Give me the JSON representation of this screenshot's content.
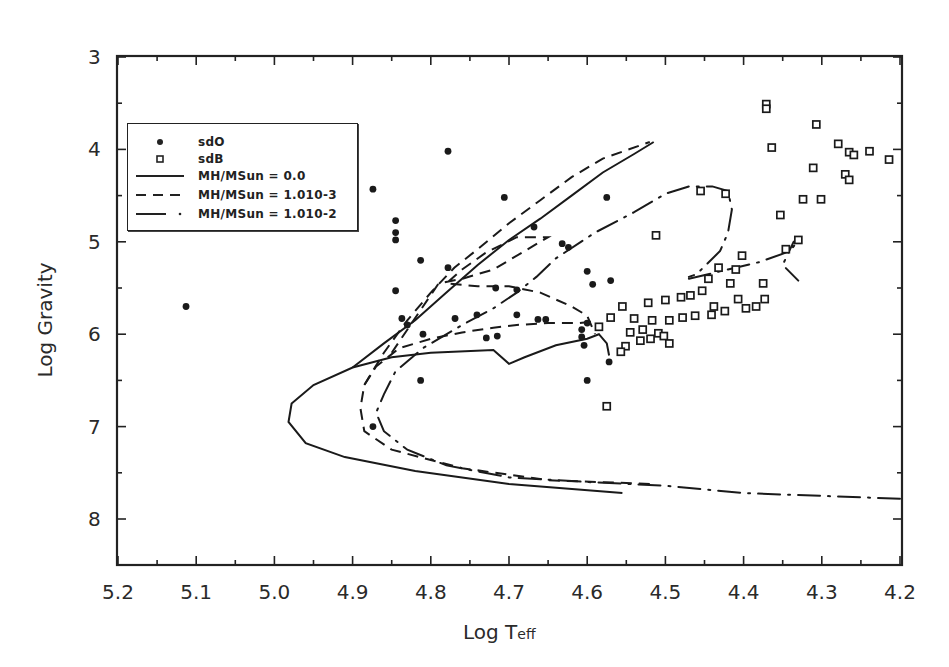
{
  "chart_data": {
    "type": "scatter",
    "title": "",
    "xlabel": "Log Teff",
    "xlabel_main": "Log T",
    "xlabel_sub": "eff",
    "ylabel": "Log Gravity",
    "xlim": [
      5.2,
      4.2
    ],
    "ylim": [
      8.5,
      3
    ],
    "x_reversed": true,
    "y_reversed": true,
    "grid": false,
    "legend_position": "upper-left",
    "x_ticks": [
      "5.2",
      "5.1",
      "5.0",
      "4.9",
      "4.8",
      "4.7",
      "4.6",
      "4.5",
      "4.4",
      "4.3",
      "4.2"
    ],
    "y_ticks": [
      "3",
      "4",
      "5",
      "6",
      "7",
      "8"
    ],
    "legend": [
      {
        "symbol": "filled-circle",
        "label": "sdO"
      },
      {
        "symbol": "open-square",
        "label": "sdB"
      },
      {
        "symbol": "solid-line",
        "label": "MH/MSun = 0.0"
      },
      {
        "symbol": "dashed-line",
        "label": "MH/MSun = 1.010-3"
      },
      {
        "symbol": "dash-dot-line",
        "label": "MH/MSun = 1.010-2"
      }
    ],
    "series": [
      {
        "name": "sdO",
        "kind": "points",
        "marker": "filled-circle",
        "points": [
          [
            5.113,
            5.7
          ],
          [
            4.874,
            4.43
          ],
          [
            4.845,
            4.77
          ],
          [
            4.845,
            4.9
          ],
          [
            4.845,
            4.98
          ],
          [
            4.845,
            5.53
          ],
          [
            4.837,
            5.83
          ],
          [
            4.83,
            5.9
          ],
          [
            4.813,
            5.2
          ],
          [
            4.813,
            6.5
          ],
          [
            4.778,
            4.02
          ],
          [
            4.778,
            5.28
          ],
          [
            4.769,
            5.83
          ],
          [
            4.741,
            5.79
          ],
          [
            4.717,
            5.5
          ],
          [
            4.729,
            6.04
          ],
          [
            4.706,
            4.52
          ],
          [
            4.69,
            5.52
          ],
          [
            4.69,
            5.79
          ],
          [
            4.668,
            4.84
          ],
          [
            4.663,
            5.84
          ],
          [
            4.653,
            5.84
          ],
          [
            4.632,
            5.02
          ],
          [
            4.624,
            5.06
          ],
          [
            4.6,
            5.32
          ],
          [
            4.593,
            5.46
          ],
          [
            4.6,
            5.88
          ],
          [
            4.607,
            5.95
          ],
          [
            4.607,
            6.03
          ],
          [
            4.604,
            6.12
          ],
          [
            4.575,
            4.52
          ],
          [
            4.57,
            5.42
          ],
          [
            4.572,
            6.3
          ],
          [
            4.6,
            6.5
          ],
          [
            4.715,
            6.02
          ],
          [
            4.874,
            7.0
          ],
          [
            4.81,
            6.0
          ]
        ]
      },
      {
        "name": "sdB",
        "kind": "points",
        "marker": "open-square",
        "points": [
          [
            4.371,
            3.51
          ],
          [
            4.371,
            3.56
          ],
          [
            4.364,
            3.98
          ],
          [
            4.307,
            3.73
          ],
          [
            4.311,
            4.2
          ],
          [
            4.279,
            3.94
          ],
          [
            4.265,
            4.03
          ],
          [
            4.259,
            4.06
          ],
          [
            4.239,
            4.02
          ],
          [
            4.214,
            4.11
          ],
          [
            4.27,
            4.27
          ],
          [
            4.265,
            4.33
          ],
          [
            4.324,
            4.54
          ],
          [
            4.301,
            4.54
          ],
          [
            4.353,
            4.71
          ],
          [
            4.346,
            5.08
          ],
          [
            4.455,
            4.45
          ],
          [
            4.423,
            4.48
          ],
          [
            4.512,
            4.93
          ],
          [
            4.33,
            4.98
          ],
          [
            4.402,
            5.15
          ],
          [
            4.41,
            5.3
          ],
          [
            4.432,
            5.28
          ],
          [
            4.445,
            5.4
          ],
          [
            4.417,
            5.45
          ],
          [
            4.453,
            5.53
          ],
          [
            4.468,
            5.58
          ],
          [
            4.375,
            5.45
          ],
          [
            4.373,
            5.62
          ],
          [
            4.384,
            5.7
          ],
          [
            4.397,
            5.72
          ],
          [
            4.407,
            5.62
          ],
          [
            4.48,
            5.6
          ],
          [
            4.5,
            5.63
          ],
          [
            4.522,
            5.66
          ],
          [
            4.438,
            5.7
          ],
          [
            4.424,
            5.75
          ],
          [
            4.441,
            5.79
          ],
          [
            4.462,
            5.8
          ],
          [
            4.478,
            5.82
          ],
          [
            4.495,
            5.85
          ],
          [
            4.517,
            5.85
          ],
          [
            4.529,
            5.95
          ],
          [
            4.545,
            5.98
          ],
          [
            4.509,
            5.99
          ],
          [
            4.502,
            6.02
          ],
          [
            4.495,
            6.1
          ],
          [
            4.532,
            6.07
          ],
          [
            4.519,
            6.05
          ],
          [
            4.551,
            6.13
          ],
          [
            4.557,
            6.19
          ],
          [
            4.575,
            6.78
          ],
          [
            4.57,
            5.82
          ],
          [
            4.585,
            5.92
          ],
          [
            4.555,
            5.7
          ],
          [
            4.54,
            5.83
          ]
        ]
      },
      {
        "name": "MH/MSun = 0.0",
        "kind": "line",
        "style": "solid",
        "points": [
          [
            4.555,
            7.72
          ],
          [
            4.7,
            7.62
          ],
          [
            4.82,
            7.48
          ],
          [
            4.91,
            7.33
          ],
          [
            4.96,
            7.18
          ],
          [
            4.982,
            6.95
          ],
          [
            4.978,
            6.75
          ],
          [
            4.95,
            6.55
          ],
          [
            4.9,
            6.36
          ],
          [
            4.85,
            6.25
          ],
          [
            4.8,
            6.2
          ],
          [
            4.72,
            6.17
          ],
          [
            4.7,
            6.32
          ],
          [
            4.68,
            6.25
          ],
          [
            4.64,
            6.12
          ],
          [
            4.6,
            6.05
          ],
          [
            4.585,
            6.0
          ],
          [
            4.575,
            6.1
          ],
          [
            4.572,
            6.23
          ]
        ],
        "upper_branch": [
          [
            4.9,
            6.36
          ],
          [
            4.86,
            6.1
          ],
          [
            4.82,
            5.85
          ],
          [
            4.78,
            5.55
          ],
          [
            4.74,
            5.25
          ],
          [
            4.7,
            4.98
          ],
          [
            4.66,
            4.75
          ],
          [
            4.62,
            4.5
          ],
          [
            4.58,
            4.25
          ],
          [
            4.54,
            4.05
          ],
          [
            4.515,
            3.92
          ]
        ]
      },
      {
        "name": "MH/MSun = 1.010-3",
        "kind": "line",
        "style": "dashed",
        "points": [
          [
            4.52,
            7.62
          ],
          [
            4.65,
            7.58
          ],
          [
            4.76,
            7.45
          ],
          [
            4.85,
            7.25
          ],
          [
            4.885,
            7.05
          ],
          [
            4.89,
            6.8
          ],
          [
            4.885,
            6.55
          ],
          [
            4.87,
            6.35
          ],
          [
            4.84,
            6.15
          ],
          [
            4.8,
            6.05
          ],
          [
            4.76,
            5.98
          ],
          [
            4.72,
            5.93
          ],
          [
            4.69,
            5.9
          ],
          [
            4.65,
            5.88
          ],
          [
            4.61,
            5.88
          ],
          [
            4.59,
            5.86
          ]
        ],
        "upper_branch": [
          [
            4.885,
            6.55
          ],
          [
            4.86,
            6.2
          ],
          [
            4.83,
            5.85
          ],
          [
            4.8,
            5.55
          ],
          [
            4.77,
            5.28
          ],
          [
            4.74,
            5.08
          ],
          [
            4.7,
            4.8
          ],
          [
            4.66,
            4.55
          ],
          [
            4.62,
            4.3
          ],
          [
            4.58,
            4.1
          ],
          [
            4.52,
            3.92
          ]
        ],
        "inner_loop": [
          [
            4.85,
            6.2
          ],
          [
            4.81,
            5.7
          ],
          [
            4.79,
            5.45
          ],
          [
            4.76,
            5.4
          ],
          [
            4.72,
            5.3
          ],
          [
            4.7,
            5.2
          ],
          [
            4.67,
            5.05
          ],
          [
            4.65,
            4.95
          ],
          [
            4.69,
            4.95
          ],
          [
            4.73,
            5.12
          ],
          [
            4.76,
            5.3
          ],
          [
            4.78,
            5.45
          ],
          [
            4.74,
            5.48
          ],
          [
            4.7,
            5.48
          ],
          [
            4.66,
            5.55
          ],
          [
            4.62,
            5.7
          ],
          [
            4.6,
            5.8
          ],
          [
            4.59,
            6.0
          ]
        ]
      },
      {
        "name": "MH/MSun = 1.010-2",
        "kind": "line",
        "style": "dash-dot",
        "points": [
          [
            4.2,
            7.78
          ],
          [
            4.3,
            7.75
          ],
          [
            4.4,
            7.72
          ],
          [
            4.5,
            7.64
          ],
          [
            4.6,
            7.6
          ],
          [
            4.7,
            7.55
          ],
          [
            4.78,
            7.42
          ],
          [
            4.83,
            7.25
          ],
          [
            4.86,
            7.05
          ],
          [
            4.87,
            6.85
          ],
          [
            4.86,
            6.65
          ],
          [
            4.845,
            6.4
          ],
          [
            4.81,
            6.15
          ],
          [
            4.76,
            5.9
          ],
          [
            4.72,
            5.72
          ],
          [
            4.69,
            5.55
          ],
          [
            4.665,
            5.38
          ],
          [
            4.64,
            5.18
          ],
          [
            4.59,
            4.9
          ],
          [
            4.54,
            4.68
          ],
          [
            4.5,
            4.48
          ],
          [
            4.47,
            4.4
          ],
          [
            4.44,
            4.4
          ],
          [
            4.42,
            4.45
          ],
          [
            4.415,
            4.65
          ],
          [
            4.42,
            4.9
          ],
          [
            4.43,
            5.1
          ],
          [
            4.46,
            5.35
          ],
          [
            4.47,
            5.38
          ]
        ],
        "loop2": [
          [
            4.47,
            5.4
          ],
          [
            4.42,
            5.3
          ],
          [
            4.38,
            5.22
          ],
          [
            4.34,
            5.1
          ],
          [
            4.328,
            4.95
          ],
          [
            4.336,
            5.0
          ],
          [
            4.35,
            5.25
          ],
          [
            4.33,
            5.42
          ]
        ]
      }
    ]
  }
}
